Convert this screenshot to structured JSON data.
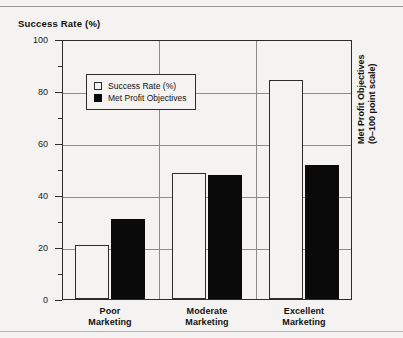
{
  "chart_data": {
    "type": "bar",
    "title": "",
    "categories": [
      "Poor\nMarketing",
      "Moderate\nMarketing",
      "Excellent\nMarketing"
    ],
    "category_lines": [
      [
        "Poor",
        "Marketing"
      ],
      [
        "Moderate",
        "Marketing"
      ],
      [
        "Excellent",
        "Marketing"
      ]
    ],
    "series": [
      {
        "name": "Success Rate (%)",
        "style": "open",
        "values": [
          21,
          49,
          85
        ]
      },
      {
        "name": "Met Profit Objectives",
        "style": "filled",
        "values": [
          31,
          48,
          52
        ]
      }
    ],
    "ylabel": "Success Rate (%)",
    "ylabel_right": "Met Profit Objectives",
    "ylabel_right_sub": "(0–100 point scale)",
    "xlabel": "",
    "ylim": [
      0,
      100
    ],
    "yticks": [
      0,
      20,
      40,
      60,
      80,
      100
    ],
    "ytick_labels": [
      "0",
      "20",
      "40",
      "60",
      "80",
      "100"
    ],
    "yminor_ticks": [
      10,
      30,
      50,
      70,
      90
    ],
    "gridlines": [
      20,
      40,
      60,
      80
    ],
    "grid": true,
    "legend_position": "upper-left-inside",
    "legend": [
      "Success Rate (%)",
      "Met Profit Objectives"
    ],
    "colors": {
      "series_open_fill": "#f4f3f1",
      "series_open_edge": "#2c2c2c",
      "series_filled": "#0a0a0a",
      "axis": "#2c2c2c",
      "grid": "#8e8c88",
      "background": "#f4f3f1",
      "text": "#111111"
    }
  },
  "axes": {
    "left_title": "Success Rate (%)",
    "right_title_line1": "Met Profit Objectives",
    "right_title_line2": "(0–100 point scale)",
    "ytick_labels": [
      "100",
      "80",
      "60",
      "40",
      "20",
      "0"
    ]
  },
  "legend": {
    "items": [
      {
        "label": "Success Rate (%)",
        "swatch": "open-square"
      },
      {
        "label": "Met Profit Objectives",
        "swatch": "filled-square"
      }
    ]
  },
  "categories": [
    {
      "line1": "Poor",
      "line2": "Marketing"
    },
    {
      "line1": "Moderate",
      "line2": "Marketing"
    },
    {
      "line1": "Excellent",
      "line2": "Marketing"
    }
  ]
}
